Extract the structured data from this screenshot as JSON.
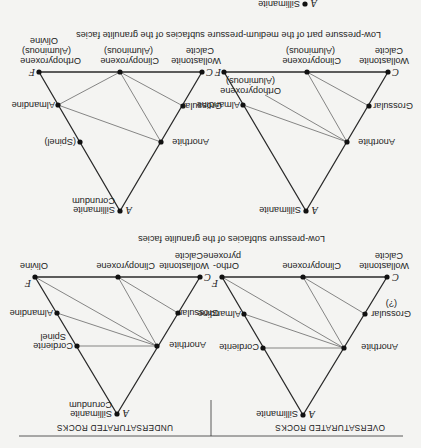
{
  "figure": {
    "orientation": "rotated 180 degrees",
    "columns": [
      {
        "header": "OVERSATURATED ROCKS"
      },
      {
        "header": "UNDERSATURATED ROCKS"
      }
    ],
    "captions": [
      "Low-pressure subfacies of the granulite facies",
      "Low-pressure part of the medium-pressure subfacies of the granulite facies"
    ],
    "diagrams": [
      {
        "id": "oversat-low-p",
        "vertices": {
          "A": "A",
          "C": "C",
          "F": "F"
        },
        "labels": {
          "apex": "Sillimanite",
          "c_top1": "Wollastonite",
          "c_top2": "Calcite",
          "cpx": "Clinopyroxene",
          "f_top1": "Ortho-",
          "f_top2": "pyroxene",
          "grossular": "Grossular",
          "grossular_q": "(?)",
          "almandine": "Almandine",
          "anorthite": "Anorthite",
          "cordierite": "Cordierite"
        }
      },
      {
        "id": "undersat-low-p",
        "vertices": {
          "A": "A",
          "C": "C",
          "F": "F"
        },
        "labels": {
          "apex1": "Sillimanite",
          "apex2": "Corundum",
          "c_top1": "Wollastonite",
          "c_top2": "Calcite",
          "cpx": "Clinopyroxene",
          "f_top": "Olivine",
          "grossular": "Grossular",
          "almandine": "Almandine",
          "anorthite": "Anorthite",
          "cordierite": "Cordierite",
          "spinel": "Spinel"
        }
      },
      {
        "id": "oversat-med-p",
        "vertices": {
          "A": "A",
          "C": "C",
          "F": "F"
        },
        "labels": {
          "apex": "Sillimanite",
          "c_top1": "Wollastonite",
          "c_top2": "Calcite",
          "cpx1": "Clinopyroxene",
          "cpx2": "(Aluminous)",
          "opx1": "Orthopyroxene",
          "opx2": "(Aluminous)",
          "grossular": "Grossular",
          "almandine": "Almandine",
          "anorthite": "Anorthite"
        }
      },
      {
        "id": "undersat-med-p",
        "vertices": {
          "A": "A",
          "C": "C",
          "F": "F"
        },
        "labels": {
          "apex1": "Sillimanite",
          "apex2": "Corundum",
          "c_top1": "Wollastonite",
          "c_top2": "Calcite",
          "cpx1": "Clinopyroxene",
          "cpx2": "(Aluminous)",
          "f_top1": "Orthopyroxene",
          "f_top2": "(Aluminous)",
          "f_top3": "Olivine",
          "grossular": "Grossular",
          "almandine": "Almandine",
          "anorthite": "Anorthite",
          "spinel": "(Spinel)"
        }
      }
    ],
    "next_diagram_apex": {
      "vertex": "A",
      "label": "Sillimanite"
    }
  }
}
